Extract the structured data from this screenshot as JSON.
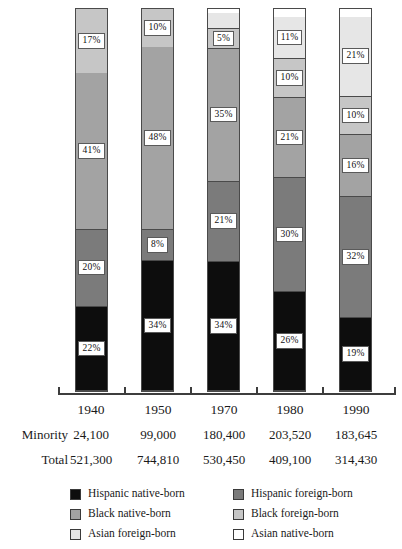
{
  "chart_data": {
    "type": "bar",
    "title": "",
    "subtitle": "",
    "xlabel": "",
    "ylabel": "",
    "ylim": [
      0,
      100
    ],
    "grid": false,
    "stacked": true,
    "stack_mode": "percent",
    "legend_position": "bottom",
    "categories": [
      "1940",
      "1950",
      "1970",
      "1980",
      "1990"
    ],
    "series": [
      {
        "name": "Hispanic native-born",
        "color": "#0d0d0d",
        "values": [
          22,
          34,
          34,
          26,
          19
        ],
        "labels": [
          "22%",
          "34%",
          "34%",
          "26%",
          "19%"
        ]
      },
      {
        "name": "Hispanic foreign-born",
        "color": "#7b7b7b",
        "values": [
          20,
          8,
          21,
          30,
          32
        ],
        "labels": [
          "20%",
          "8%",
          "21%",
          "30%",
          "32%"
        ]
      },
      {
        "name": "Black native-born",
        "color": "#a3a3a3",
        "values": [
          41,
          48,
          35,
          21,
          16
        ],
        "labels": [
          "41%",
          "48%",
          "35%",
          "21%",
          "16%"
        ]
      },
      {
        "name": "Black foreign-born",
        "color": "#c6c6c6",
        "values": [
          17,
          10,
          5,
          10,
          10
        ],
        "labels": [
          "17%",
          "10%",
          "5%",
          "10%",
          "10%"
        ]
      },
      {
        "name": "Asian foreign-born",
        "color": "#e6e6e6",
        "values": [
          0,
          0,
          4,
          11,
          21
        ],
        "labels": [
          "",
          "",
          "",
          "11%",
          "21%"
        ]
      },
      {
        "name": "Asian native-born",
        "color": "#ffffff",
        "values": [
          0,
          0,
          1,
          2,
          2
        ],
        "labels": [
          "",
          "",
          "",
          "",
          ""
        ]
      }
    ],
    "annotations": {
      "row_labels": [
        "Minority",
        "Total"
      ],
      "rows": [
        {
          "label": "Minority",
          "values": [
            "24,100",
            "99,000",
            "180,400",
            "203,520",
            "183,645"
          ]
        },
        {
          "label": "Total",
          "values": [
            "521,300",
            "744,810",
            "530,450",
            "409,100",
            "314,430"
          ]
        }
      ]
    }
  },
  "axis": {
    "years": [
      "1940",
      "1950",
      "1970",
      "1980",
      "1990"
    ]
  },
  "table": {
    "year_row": [
      "1940",
      "1950",
      "1970",
      "1980",
      "1990"
    ],
    "minority_label": "Minority",
    "minority_values": [
      "24,100",
      "99,000",
      "180,400",
      "203,520",
      "183,645"
    ],
    "total_label": "Total",
    "total_values": [
      "521,300",
      "744,810",
      "530,450",
      "409,100",
      "314,430"
    ]
  },
  "legend": {
    "left_column": [
      {
        "label": "Hispanic native-born",
        "color": "#0d0d0d"
      },
      {
        "label": "Black native-born",
        "color": "#a3a3a3"
      },
      {
        "label": "Asian foreign-born",
        "color": "#e6e6e6"
      }
    ],
    "right_column": [
      {
        "label": "Hispanic foreign-born",
        "color": "#7b7b7b"
      },
      {
        "label": "Black foreign-born",
        "color": "#c6c6c6"
      },
      {
        "label": "Asian native-born",
        "color": "#ffffff"
      }
    ]
  }
}
